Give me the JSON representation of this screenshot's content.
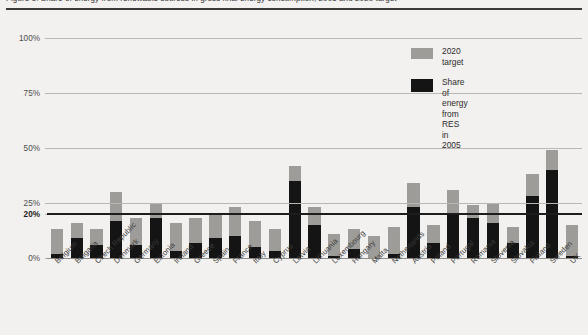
{
  "figure": {
    "title": "Figure 1: Share of energy from renewable sources in gross final energy consumption, 2005 and 2020 target",
    "background_color": "#f2f1ef"
  },
  "legend": {
    "position": "top-right",
    "entries": [
      {
        "label": "2020 target",
        "color": "#9e9c99",
        "swatch": "target-swatch"
      },
      {
        "label": "Share of energy from\nRES in 2005",
        "color": "#141414",
        "swatch": "res-swatch"
      }
    ]
  },
  "axis": {
    "y_ticks": [
      "100%",
      "75%",
      "50%",
      "25%",
      "20%",
      "0%"
    ],
    "y_tick_values": [
      100,
      75,
      50,
      25,
      20,
      0
    ],
    "y_emphasis_tick": "20%"
  },
  "chart_data": {
    "type": "bar",
    "title": "Share of energy from renewable sources in gross final energy consumption, 2005 and 2020 target",
    "xlabel": "",
    "ylabel": "",
    "ylim": [
      0,
      100
    ],
    "grid": true,
    "legend_position": "top-right",
    "categories": [
      "Belgium",
      "Bulgaria",
      "Czech Republic",
      "Denmark",
      "Germany",
      "Estonia",
      "Ireland",
      "Greece",
      "Spain",
      "France",
      "Italy",
      "Cyprus",
      "Latvia",
      "Lithuania",
      "Luxembourg",
      "Hungary",
      "Malta",
      "Netherlands",
      "Austria",
      "Poland",
      "Portugal",
      "Romania",
      "Slovenia",
      "Slovakia",
      "Finland",
      "Sweden",
      "UK"
    ],
    "series": [
      {
        "name": "2020 target",
        "color": "#9e9c99",
        "values": [
          13,
          16,
          13,
          30,
          18,
          25,
          16,
          18,
          20,
          23,
          17,
          13,
          42,
          23,
          11,
          13,
          10,
          14,
          34,
          15,
          31,
          24,
          25,
          14,
          38,
          49,
          15
        ]
      },
      {
        "name": "Share of energy from RES in 2005",
        "color": "#141414",
        "values": [
          2,
          9,
          6,
          17,
          6,
          18,
          3,
          7,
          9,
          10,
          5,
          3,
          35,
          15,
          1,
          4,
          0,
          2,
          23,
          7,
          20,
          18,
          16,
          7,
          28,
          40,
          1
        ]
      }
    ],
    "annotations": [
      {
        "text": "20%",
        "y": 20,
        "style": "bold-horizontal-line",
        "color": "#1d1d1d"
      }
    ]
  }
}
